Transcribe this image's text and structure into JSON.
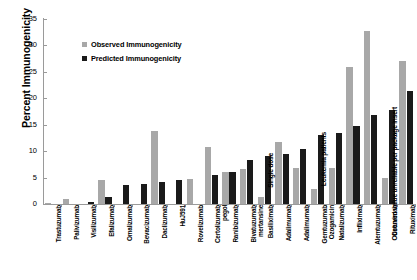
{
  "chart_data": {
    "type": "bar",
    "title": "",
    "xlabel": "",
    "ylabel": "Percent Immunogenicity",
    "ylim": [
      0,
      35
    ],
    "yticks": [
      0,
      5,
      10,
      15,
      20,
      25,
      30,
      35
    ],
    "grid": false,
    "legend_position": "upper-left-inside",
    "categories": [
      "Trastuzumab",
      "Palivizumab",
      "Visilizumab",
      "Efalizumab",
      "Omalizumab",
      "Bevacizumab",
      "Daclizumab",
      "HuJ591",
      "Rovelizumab",
      "Certolizumab pegol",
      "Ranibizumab",
      "Bivatuzumab mertansine",
      "Basiliximab",
      "Adalimumab",
      "Adalimumab",
      "Gemtuzumab Ozogamicin",
      "Natalizumab",
      "Infliximab",
      "Alemtuzumab",
      "Cetuximab",
      "Rituximab"
    ],
    "category_lines": [
      [
        "Trastuzumab",
        ""
      ],
      [
        "Palivizumab",
        ""
      ],
      [
        "Visilizumab",
        ""
      ],
      [
        "Efalizumab",
        ""
      ],
      [
        "Omalizumab",
        ""
      ],
      [
        "Bevacizumab",
        ""
      ],
      [
        "Daclizumab",
        ""
      ],
      [
        "HuJ591",
        ""
      ],
      [
        "Rovelizumab",
        ""
      ],
      [
        "Certolizumab",
        "pegol"
      ],
      [
        "Ranibizumab",
        ""
      ],
      [
        "Bivatuzumab",
        "mertansine"
      ],
      [
        "Basiliximab",
        ""
      ],
      [
        "Adalimumab",
        ""
      ],
      [
        "Adalimumab",
        ""
      ],
      [
        "Gemtuzumab",
        "Ozogamicin"
      ],
      [
        "Natalizumab",
        ""
      ],
      [
        "Infliximab",
        ""
      ],
      [
        "Alemtuzumab",
        ""
      ],
      [
        "Cetuximab",
        ""
      ],
      [
        "Rituximab",
        ""
      ]
    ],
    "series": [
      {
        "name": "Observed Immunogenicity",
        "color": "#a8a8a8",
        "values": [
          0.1,
          0.9,
          0,
          4.6,
          0,
          0,
          13.9,
          0,
          4.7,
          10.8,
          6.0,
          6.6,
          1.3,
          11.8,
          6.8,
          2.8,
          6.8,
          25.9,
          32.8,
          5.0,
          27.0
        ]
      },
      {
        "name": "Predicted Immunogenicity",
        "color": "#1a1a1a",
        "values": [
          0,
          0,
          0.4,
          1.4,
          3.6,
          3.7,
          4.1,
          4.6,
          0,
          5.4,
          6.1,
          8.3,
          9.0,
          9.4,
          10.4,
          13.0,
          13.5,
          14.7,
          16.8,
          17.8,
          21.3
        ]
      }
    ],
    "annotations": [
      {
        "text": "Single dose",
        "category": "Basiliximab"
      },
      {
        "text": "Leukemia patients",
        "category": "Gemtuzumab Ozogamicin"
      },
      {
        "text": "Observed value unreliable per package insert",
        "category": "Cetuximab"
      }
    ]
  }
}
